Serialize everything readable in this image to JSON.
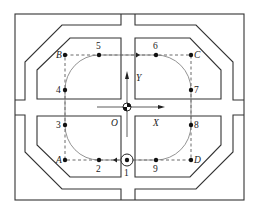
{
  "diagram": {
    "type": "robot-path-layout",
    "axes": {
      "origin_label": "O",
      "x_label": "X",
      "y_label": "Y"
    },
    "corners": {
      "A": "A",
      "B": "B",
      "C": "C",
      "D": "D"
    },
    "waypoints": [
      "1",
      "2",
      "3",
      "4",
      "5",
      "6",
      "7",
      "8",
      "9"
    ],
    "labels": {
      "p1": "1",
      "p2": "2",
      "p3": "3",
      "p4": "4",
      "p5": "5",
      "p6": "6",
      "p7": "7",
      "p8": "8",
      "p9": "9"
    },
    "colors": {
      "line": "#333333",
      "path": "#777777",
      "point": "#111111",
      "background": "#ffffff"
    }
  }
}
